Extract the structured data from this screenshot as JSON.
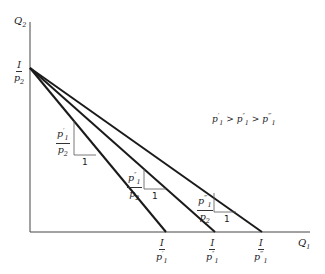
{
  "axes": {
    "y_label": "Q2",
    "x_label": "Q1"
  },
  "intercept_y": {
    "num": "I",
    "den": "p2"
  },
  "intercepts_x": [
    {
      "num": "I",
      "den": "p′1"
    },
    {
      "num": "I",
      "den": "p″1"
    },
    {
      "num": "I",
      "den": "p‴1"
    }
  ],
  "slopes": [
    {
      "num": "p′1",
      "den": "p2",
      "run": "1"
    },
    {
      "num": "p″1",
      "den": "p2",
      "run": "1"
    },
    {
      "num": "p‴1",
      "den": "p2",
      "run": "1"
    }
  ],
  "annotation": "p′1 > p″1 > p‴1",
  "colors": {
    "line": "#1a1a1a",
    "axis": "#333333"
  }
}
